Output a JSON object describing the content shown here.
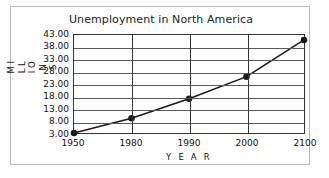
{
  "chart_data": {
    "type": "line",
    "title": "Unemployment in North America",
    "xlabel": "Y E A R",
    "ylabel": "M I L L I O N S",
    "x": [
      1950,
      1980,
      1990,
      2000,
      2100
    ],
    "x_tick_labels": [
      "1950",
      "1980",
      "1990",
      "2000",
      "2100"
    ],
    "values": [
      3.0,
      9.0,
      17.0,
      26.0,
      41.0
    ],
    "y_tick_labels": [
      "43.00",
      "38.00",
      "33.00",
      "28.00",
      "23.00",
      "18.00",
      "13.00",
      "8.00",
      "3.00"
    ],
    "y_ticks": [
      43,
      38,
      33,
      28,
      23,
      18,
      13,
      8,
      3
    ],
    "ylim": [
      3,
      43
    ],
    "grid": "both",
    "legend": "none",
    "marker": "filled-circle",
    "line_color": "#1a1a1a",
    "marker_color": "#1a1a1a",
    "grid_color": "#5a5a5a",
    "frame_color": "#b9b9b9",
    "background": "#ffffff"
  }
}
